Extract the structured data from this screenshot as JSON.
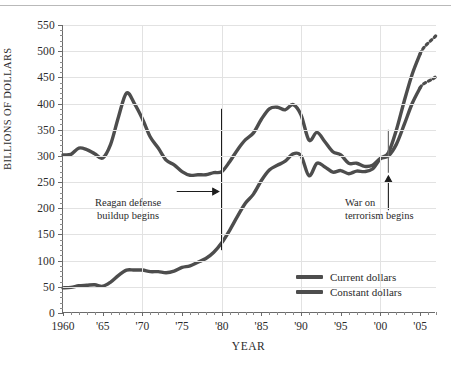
{
  "page": {
    "top_partial_text": "",
    "caption": ""
  },
  "chart_data": {
    "type": "line",
    "title": "",
    "xlabel": "YEAR",
    "ylabel": "BILLIONS OF DOLLARS",
    "xlim": [
      1960,
      2007
    ],
    "ylim": [
      0,
      550
    ],
    "yticks": [
      0,
      50,
      100,
      150,
      200,
      250,
      300,
      350,
      400,
      450,
      500,
      550
    ],
    "ytick_labels": [
      "0",
      "50",
      "100",
      "150",
      "200",
      "250",
      "300",
      "350",
      "400",
      "450",
      "500",
      "550"
    ],
    "xticks": [
      1960,
      1965,
      1970,
      1975,
      1980,
      1985,
      1990,
      1995,
      2000,
      2005
    ],
    "xtick_labels": [
      "1960",
      "'65",
      "'70",
      "'75",
      "'80",
      "'85",
      "'90",
      "'95",
      "'00",
      "'05"
    ],
    "grid": true,
    "legend_position": "bottom-right",
    "line_color": "#4d4d4d",
    "grid_color": "#e2e2e2",
    "axis_color": "#6a6a6a",
    "series": [
      {
        "name": "Current dollars",
        "x": [
          1960,
          1961,
          1962,
          1963,
          1964,
          1965,
          1966,
          1967,
          1968,
          1969,
          1970,
          1971,
          1972,
          1973,
          1974,
          1975,
          1976,
          1977,
          1978,
          1979,
          1980,
          1981,
          1982,
          1983,
          1984,
          1985,
          1986,
          1987,
          1988,
          1989,
          1990,
          1991,
          1992,
          1993,
          1994,
          1995,
          1996,
          1997,
          1998,
          1999,
          2000,
          2001,
          2002,
          2003,
          2004,
          2005
        ],
        "values": [
          48,
          49,
          52,
          53,
          54,
          51,
          59,
          72,
          82,
          82,
          82,
          79,
          79,
          77,
          80,
          87,
          90,
          97,
          104,
          116,
          134,
          158,
          185,
          210,
          227,
          253,
          273,
          282,
          290,
          304,
          300,
          262,
          286,
          279,
          269,
          272,
          266,
          271,
          270,
          275,
          295,
          306,
          349,
          405,
          456,
          495
        ],
        "estimate_from": 2005,
        "estimate_values": [
          530
        ]
      },
      {
        "name": "Constant dollars",
        "x": [
          1960,
          1961,
          1962,
          1963,
          1964,
          1965,
          1966,
          1967,
          1968,
          1969,
          1970,
          1971,
          1972,
          1973,
          1974,
          1975,
          1976,
          1977,
          1978,
          1979,
          1980,
          1981,
          1982,
          1983,
          1984,
          1985,
          1986,
          1987,
          1988,
          1989,
          1990,
          1991,
          1992,
          1993,
          1994,
          1995,
          1996,
          1997,
          1998,
          1999,
          2000,
          2001,
          2002,
          2003,
          2004,
          2005
        ],
        "values": [
          302,
          303,
          315,
          312,
          304,
          296,
          322,
          375,
          420,
          400,
          371,
          336,
          315,
          292,
          283,
          270,
          263,
          264,
          264,
          268,
          270,
          289,
          312,
          331,
          344,
          370,
          390,
          393,
          388,
          398,
          378,
          330,
          345,
          327,
          308,
          302,
          286,
          286,
          280,
          282,
          295,
          300,
          322,
          360,
          400,
          430
        ],
        "estimate_from": 2005,
        "estimate_values": [
          452
        ]
      }
    ],
    "annotations": [
      {
        "name": "reagan-marker",
        "line1": "Reagan defense",
        "line2": "buildup begins",
        "year": 1980,
        "arrow": "right"
      },
      {
        "name": "terror-marker",
        "line1": "War on",
        "line2": "terrorism begins",
        "year": 2001,
        "arrow": "up"
      }
    ],
    "estimate_note": {
      "label": "ESTIMATE for 2006–2007",
      "swatch": "dotted-hatch-swatch"
    }
  }
}
